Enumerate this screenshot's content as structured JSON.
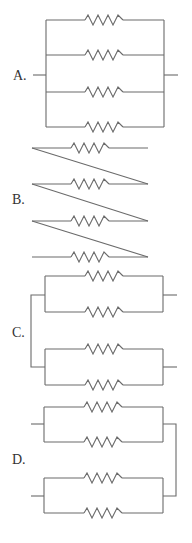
{
  "diagram": {
    "type": "resistor-circuit-options",
    "resistor_count_per_option": 4,
    "options": [
      {
        "label": "A.",
        "description": "Four resistors all in parallel"
      },
      {
        "label": "B.",
        "description": "Four resistors connected in series (zigzag)"
      },
      {
        "label": "C.",
        "description": "Two parallel pairs, joined on left, separate right terminals"
      },
      {
        "label": "D.",
        "description": "Two parallel pairs, joined on right, separate left terminals"
      }
    ]
  },
  "colors": {
    "wire": "#6b6b6b",
    "label": "#333333",
    "background": "#ffffff"
  }
}
